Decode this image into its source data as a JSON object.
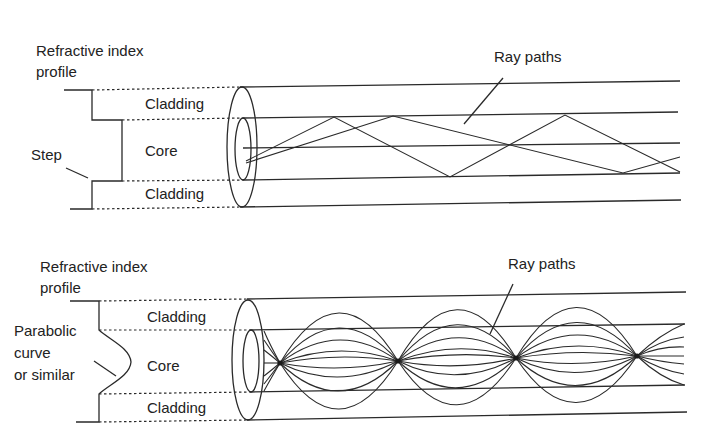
{
  "figure": {
    "colors": {
      "ink": "#2a2a2a",
      "background": "#ffffff"
    }
  },
  "step_index": {
    "profile_label_line1": "Refractive index",
    "profile_label_line2": "profile",
    "cladding_top_label": "Cladding",
    "core_label": "Core",
    "cladding_bottom_label": "Cladding",
    "profile_shape_label": "Step",
    "ray_label": "Ray paths"
  },
  "graded_index": {
    "profile_label_line1": "Refractive index",
    "profile_label_line2": "profile",
    "cladding_top_label": "Cladding",
    "core_label": "Core",
    "cladding_bottom_label": "Cladding",
    "profile_shape_label_line1": "Parabolic",
    "profile_shape_label_line2": "curve",
    "profile_shape_label_line3": "or similar",
    "ray_label": "Ray paths"
  }
}
